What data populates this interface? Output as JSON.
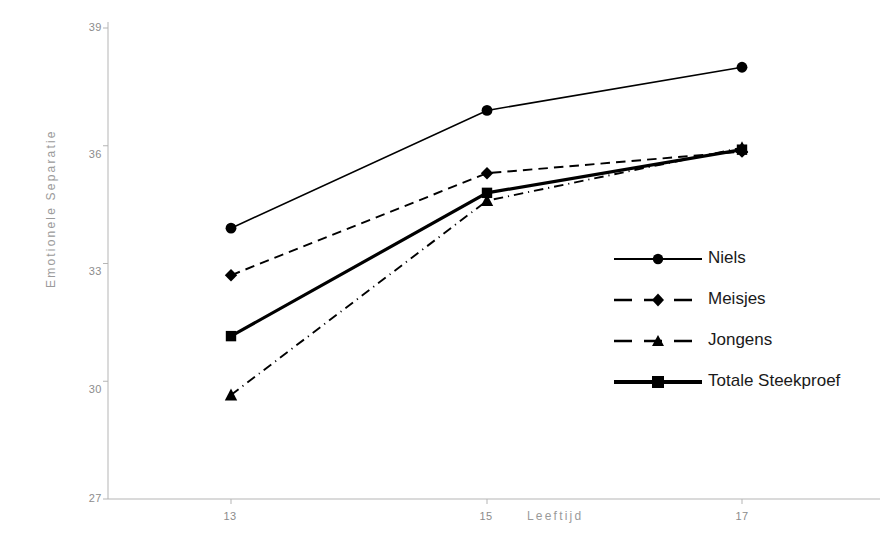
{
  "chart_data": {
    "type": "line",
    "title": "",
    "xlabel": "Leeftijd",
    "ylabel": "Emotionele Separatie",
    "x": [
      13,
      15,
      17
    ],
    "categories": [
      "13",
      "15",
      "17"
    ],
    "xtick_labels": [
      "13",
      "15",
      "17"
    ],
    "ytick_labels": [
      "39",
      "36",
      "33",
      "30",
      "27"
    ],
    "xlim": [
      12.5,
      17.5
    ],
    "ylim": [
      27,
      39
    ],
    "yticks": [
      27,
      30,
      33,
      36,
      39
    ],
    "grid": false,
    "legend_position": "center-right",
    "series": [
      {
        "name": "Niels",
        "values": [
          33.9,
          36.9,
          38.0
        ],
        "line_style": "solid",
        "marker": "circle",
        "line_width": 1.6,
        "color": "#000000"
      },
      {
        "name": "Meisjes",
        "values": [
          32.7,
          35.3,
          35.85
        ],
        "line_style": "dashed",
        "marker": "diamond",
        "line_width": 1.9,
        "color": "#000000"
      },
      {
        "name": "Jongens",
        "values": [
          29.65,
          34.6,
          35.95
        ],
        "line_style": "dash-dot",
        "marker": "triangle",
        "line_width": 1.9,
        "color": "#000000"
      },
      {
        "name": "Totale Steekproef",
        "values": [
          31.15,
          34.8,
          35.9
        ],
        "line_style": "solid",
        "marker": "square",
        "line_width": 3.2,
        "color": "#000000"
      }
    ]
  },
  "axes": {
    "y_title": "Emotionele Separatie",
    "x_title": "Leeftijd",
    "y_ticks": [
      {
        "label": "39",
        "value": 39
      },
      {
        "label": "36",
        "value": 36
      },
      {
        "label": "33",
        "value": 33
      },
      {
        "label": "30",
        "value": 30
      },
      {
        "label": "27",
        "value": 27
      }
    ],
    "x_ticks": [
      {
        "label": "13",
        "value": 13
      },
      {
        "label": "15",
        "value": 15
      },
      {
        "label": "17",
        "value": 17
      }
    ]
  },
  "legend": {
    "items": [
      {
        "label": "Niels"
      },
      {
        "label": "Meisjes"
      },
      {
        "label": "Jongens"
      },
      {
        "label": "Totale Steekproef"
      }
    ]
  },
  "colors": {
    "line": "#000000",
    "axis": "#b5b5b5",
    "tick_text": "#8c8c8c",
    "legend_text": "#1a1a1a",
    "background": "#ffffff"
  }
}
